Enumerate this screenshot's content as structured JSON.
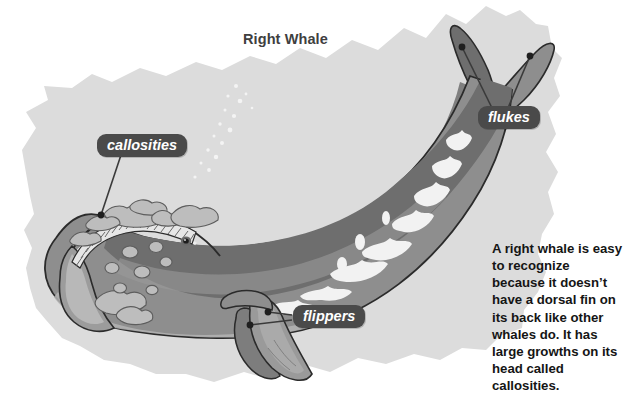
{
  "figure": {
    "title": "Right Whale",
    "background_shape": "torn-paper-blob"
  },
  "callouts": [
    {
      "id": "callosities",
      "label": "callosities"
    },
    {
      "id": "flukes",
      "label": "flukes"
    },
    {
      "id": "flippers",
      "label": "flippers"
    }
  ],
  "description": {
    "text": "A right whale is easy to recognize because it doesn’t have a dorsal fin on its back like other whales do. It has large growths on its head called callosities."
  },
  "colors": {
    "page_background": "#ffffff",
    "blob_background": "#dcdcdc",
    "whale_body": "#8e8e8e",
    "whale_back_dark": "#6e6e6e",
    "whale_belly_light": "#b4b4b4",
    "whale_outline": "#2b2b2b",
    "callosity": "#b9b9b9",
    "white_patch": "#f2f2f2",
    "callout_pill": "#4a4a4a",
    "callout_text": "#ffffff",
    "title_text": "#3f3f3f",
    "body_text": "#151515",
    "leader_line": "#3a3a3a"
  }
}
